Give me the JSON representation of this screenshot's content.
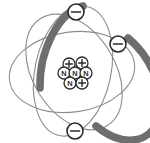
{
  "figure": {
    "background_color": "#ffffff",
    "width": 150,
    "height": 143
  },
  "colors": {
    "thin_orbit": "#8d8d8d",
    "thick_orbit": "#6e6e6e",
    "outline": "#2b2b2b",
    "fill": "#ffffff"
  },
  "orbits": [
    {
      "name": "horizontal-orbit",
      "style": "thin",
      "cx": 72,
      "cy": 72,
      "rx": 63,
      "ry": 40,
      "rotation": -8
    },
    {
      "name": "vertical-orbit",
      "style": "thick-and-thin",
      "cx": 73,
      "cy": 71,
      "rx": 38,
      "ry": 66,
      "rotation": 12
    },
    {
      "name": "diagonal-orbit",
      "style": "thick-and-thin",
      "cx": 74,
      "cy": 72,
      "rx": 63,
      "ry": 41,
      "rotation": 58
    }
  ],
  "electrons": [
    {
      "name": "electron-top",
      "label": "-",
      "cx": 76,
      "cy": 12,
      "r": 8
    },
    {
      "name": "electron-right",
      "label": "-",
      "cx": 118,
      "cy": 44,
      "r": 8
    },
    {
      "name": "electron-bottom",
      "label": "-",
      "cx": 75,
      "cy": 131,
      "r": 8
    }
  ],
  "nucleus": {
    "name": "nucleus-cluster",
    "center_x": 76,
    "center_y": 73,
    "particles": [
      {
        "name": "proton-1",
        "type": "proton",
        "label": "+",
        "cx": 69,
        "cy": 64,
        "r": 6
      },
      {
        "name": "proton-2",
        "type": "proton",
        "label": "+",
        "cx": 82,
        "cy": 63,
        "r": 6
      },
      {
        "name": "neutron-1",
        "type": "neutron",
        "label": "N",
        "cx": 64,
        "cy": 73,
        "r": 6
      },
      {
        "name": "neutron-2",
        "type": "neutron",
        "label": "N",
        "cx": 75,
        "cy": 73,
        "r": 6
      },
      {
        "name": "neutron-3",
        "type": "neutron",
        "label": "N",
        "cx": 86,
        "cy": 73,
        "r": 6
      },
      {
        "name": "neutron-4",
        "type": "neutron",
        "label": "N",
        "cx": 70,
        "cy": 83,
        "r": 6
      },
      {
        "name": "proton-3",
        "type": "proton",
        "label": "+",
        "cx": 82,
        "cy": 83,
        "r": 6
      }
    ],
    "proton_count": 3,
    "neutron_count": 4
  }
}
